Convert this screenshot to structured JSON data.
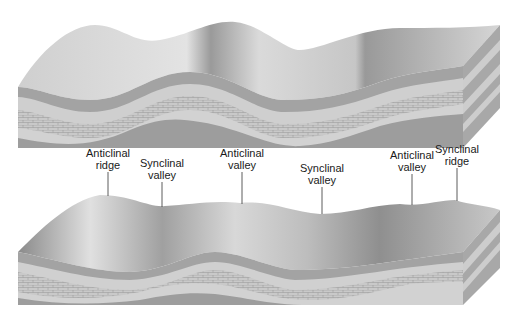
{
  "diagram": {
    "type": "block-diagram",
    "colors": {
      "surface_light": "#d4d4d4",
      "surface_dark": "#8c8c8c",
      "layer_dark": "#9a9a9a",
      "layer_light": "#cfcfcf",
      "layer_brick": "#bdbdbd",
      "side_face": "#a8a8a8"
    },
    "top_block": {
      "description": "Unweathered folded landscape"
    },
    "bottom_block": {
      "description": "Eroded folded landscape",
      "labels": [
        {
          "line1": "Anticlinal",
          "line2": "ridge",
          "x": 108,
          "y": 147
        },
        {
          "line1": "Synclinal",
          "line2": "valley",
          "x": 162,
          "y": 157
        },
        {
          "line1": "Anticlinal",
          "line2": "valley",
          "x": 242,
          "y": 147
        },
        {
          "line1": "Synclinal",
          "line2": "valley",
          "x": 322,
          "y": 162
        },
        {
          "line1": "Anticlinal",
          "line2": "valley",
          "x": 412,
          "y": 149
        },
        {
          "line1": "Synclinal",
          "line2": "ridge",
          "x": 457,
          "y": 143
        }
      ]
    }
  }
}
